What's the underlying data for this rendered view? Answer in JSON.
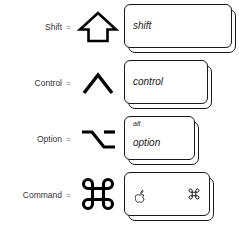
{
  "chart": {
    "ink_color": "#1a1a1a",
    "text_color": "#333333",
    "equals_color": "#7d7d7d",
    "background": "#ffffff",
    "equals_sign": "="
  },
  "rows": [
    {
      "name": "shift",
      "label": "Shift",
      "equals": "=",
      "symbol_name": "shift-arrow-symbol",
      "symbol_char": "⇧",
      "keycap": {
        "primary_legend": "shift",
        "secondary_legend": "",
        "width": 108,
        "height": 44
      }
    },
    {
      "name": "control",
      "label": "Control",
      "equals": "=",
      "symbol_name": "control-caret-symbol",
      "symbol_char": "⌃",
      "keycap": {
        "primary_legend": "control",
        "secondary_legend": "",
        "width": 84,
        "height": 44
      }
    },
    {
      "name": "option",
      "label": "Option",
      "equals": "=",
      "symbol_name": "option-alt-symbol",
      "symbol_char": "⌥",
      "keycap": {
        "primary_legend": "option",
        "secondary_legend": "alt",
        "width": 71,
        "height": 44
      }
    },
    {
      "name": "command",
      "label": "Command",
      "equals": "=",
      "symbol_name": "command-cloverleaf-symbol",
      "symbol_char": "⌘",
      "keycap": {
        "primary_legend": "",
        "secondary_legend": "",
        "apple_legend": "",
        "command_legend": "⌘",
        "width": 86,
        "height": 44
      }
    }
  ]
}
